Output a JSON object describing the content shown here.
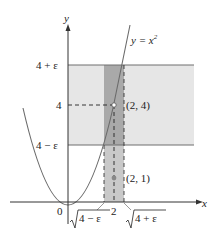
{
  "diagram": {
    "axes": {
      "x_label": "x",
      "y_label": "y",
      "origin_label": "0"
    },
    "curve_label_prefix": "y = x",
    "curve_label_exponent": "2",
    "y_ticks": {
      "upper": "4 + ε",
      "mid": "4",
      "lower": "4 − ε"
    },
    "x_ticks": {
      "left_radicand": "4 − ε",
      "center": "2",
      "right_radicand": "4 + ε"
    },
    "points": {
      "upper": "(2, 4)",
      "lower": "(2, 1)"
    },
    "colors": {
      "band_light": "#e6e6e6",
      "band_dark": "#a9a9a9",
      "curve": "#6b6b6b",
      "axis": "#333333",
      "band_edge": "#6e6e6e"
    }
  }
}
